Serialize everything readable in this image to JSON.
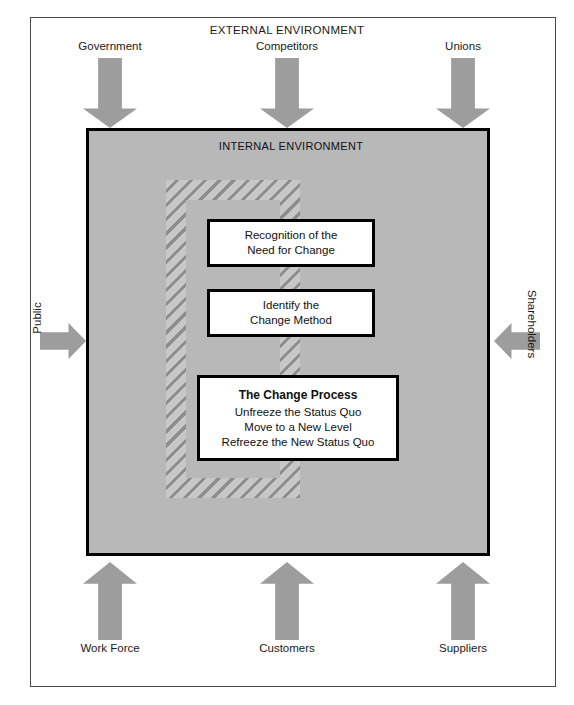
{
  "diagram": {
    "external_title": "EXTERNAL ENVIRONMENT",
    "internal_title": "INTERNAL ENVIRONMENT",
    "top_inputs": [
      {
        "label": "Government",
        "icon": "arrow-down-icon"
      },
      {
        "label": "Competitors",
        "icon": "arrow-down-icon"
      },
      {
        "label": "Unions",
        "icon": "arrow-down-icon"
      }
    ],
    "bottom_inputs": [
      {
        "label": "Work Force",
        "icon": "arrow-up-icon"
      },
      {
        "label": "Customers",
        "icon": "arrow-up-icon"
      },
      {
        "label": "Suppliers",
        "icon": "arrow-up-icon"
      }
    ],
    "left_input": {
      "label": "Public",
      "icon": "arrow-right-icon"
    },
    "right_input": {
      "label": "Shareholders",
      "icon": "arrow-left-icon"
    },
    "process_boxes": [
      {
        "id": "recognition",
        "lines": [
          "Recognition of the",
          "Need for Change"
        ]
      },
      {
        "id": "identify",
        "lines": [
          "Identify the",
          "Change Method"
        ]
      },
      {
        "id": "change-process",
        "headline": "The Change Process",
        "lines": [
          "Unfreeze the Status Quo",
          "Move to a New Level",
          "Refreeze the New Status Quo"
        ]
      }
    ],
    "colors": {
      "arrow_gray": "#9d9d9d",
      "internal_panel_gray": "#b8b8b8",
      "hatch_dark": "#8e8e8e",
      "hatch_light": "#c7c7c7",
      "box_border": "#000000",
      "frame_border": "#4a4a4a",
      "text": "#111111"
    }
  }
}
